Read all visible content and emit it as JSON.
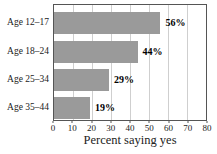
{
  "chart_data": {
    "type": "bar",
    "orientation": "horizontal",
    "title": "",
    "categories": [
      "Age 12–17",
      "Age 18–24",
      "Age 25–34",
      "Age 35–44"
    ],
    "values": [
      56,
      44,
      29,
      19
    ],
    "value_labels": [
      "56%",
      "44%",
      "29%",
      "19%"
    ],
    "xlabel": "Percent saying yes",
    "xlim": [
      0,
      80
    ],
    "xticks": [
      0,
      10,
      20,
      30,
      40,
      50,
      60,
      70,
      80
    ],
    "grid": true,
    "legend": "none",
    "bar_color": "#9a9a9a",
    "gridline_color": "#cfcfcf",
    "plot_border_color": "#555555",
    "value_label_color": "#000000",
    "text_color": "#222222",
    "background_color": "#ffffff"
  }
}
